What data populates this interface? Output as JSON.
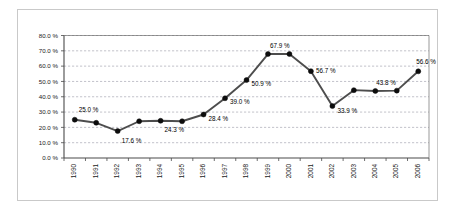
{
  "chart_data": {
    "type": "line",
    "title": "",
    "subtitle": "",
    "xlabel": "",
    "ylabel": "",
    "categories": [
      "1990",
      "1991",
      "1992",
      "1993",
      "1994",
      "1995",
      "1996",
      "1997",
      "1998",
      "1999",
      "2000",
      "2001",
      "2002",
      "2003",
      "2004",
      "2005",
      "2006"
    ],
    "values": [
      25.0,
      23.0,
      17.6,
      24.0,
      24.3,
      24.0,
      28.4,
      39.0,
      50.9,
      67.9,
      67.9,
      56.7,
      33.9,
      44.3,
      43.8,
      44.0,
      56.6
    ],
    "ylim": [
      0,
      80
    ],
    "ytick_values": [
      0,
      10,
      20,
      30,
      40,
      50,
      60,
      70,
      80
    ],
    "ytick_labels": [
      "0.0 %",
      "10.0 %",
      "20.0 %",
      "30.0 %",
      "40.0 %",
      "50.0 %",
      "60.0 %",
      "70.0 %",
      "80.0 %"
    ],
    "grid": true,
    "grid_axis": "y",
    "legend": false,
    "legend_position": "none",
    "marker": "circle",
    "point_labels": [
      {
        "category": "1990",
        "value": 25.0,
        "text": "25.0 %",
        "dx": 4,
        "dy": -9
      },
      {
        "category": "1992",
        "value": 17.6,
        "text": "17.6 %",
        "dx": 4,
        "dy": 10
      },
      {
        "category": "1994",
        "value": 24.3,
        "text": "24.3 %",
        "dx": 4,
        "dy": 10
      },
      {
        "category": "1996",
        "value": 28.4,
        "text": "28.4 %",
        "dx": 5,
        "dy": 5
      },
      {
        "category": "1997",
        "value": 39.0,
        "text": "39.0 %",
        "dx": 5,
        "dy": 4
      },
      {
        "category": "1998",
        "value": 50.9,
        "text": "50.9 %",
        "dx": 5,
        "dy": 4
      },
      {
        "category": "1999",
        "value": 67.9,
        "text": "67.9 %",
        "dx": 2,
        "dy": -8
      },
      {
        "category": "2001",
        "value": 56.7,
        "text": "56.7 %",
        "dx": 5,
        "dy": 0
      },
      {
        "category": "2002",
        "value": 33.9,
        "text": "33.9 %",
        "dx": 5,
        "dy": 5
      },
      {
        "category": "2004",
        "value": 43.8,
        "text": "43.8 %",
        "dx": 1,
        "dy": -8
      },
      {
        "category": "2006",
        "value": 56.6,
        "text": "56.6 %",
        "dx": -2,
        "dy": -9
      }
    ],
    "series": [
      {
        "name": "",
        "values": [
          25.0,
          23.0,
          17.6,
          24.0,
          24.3,
          24.0,
          28.4,
          39.0,
          50.9,
          67.9,
          67.9,
          56.7,
          33.9,
          44.3,
          43.8,
          44.0,
          56.6
        ]
      }
    ],
    "colors": {
      "line": "#4d4d4d",
      "marker": "#0d0d0d",
      "grid": "#9a9aa8",
      "axis": "#4a4a4a",
      "frame": "#c9c9c9",
      "background": "#ffffff",
      "text": "#1a1a1a"
    }
  }
}
